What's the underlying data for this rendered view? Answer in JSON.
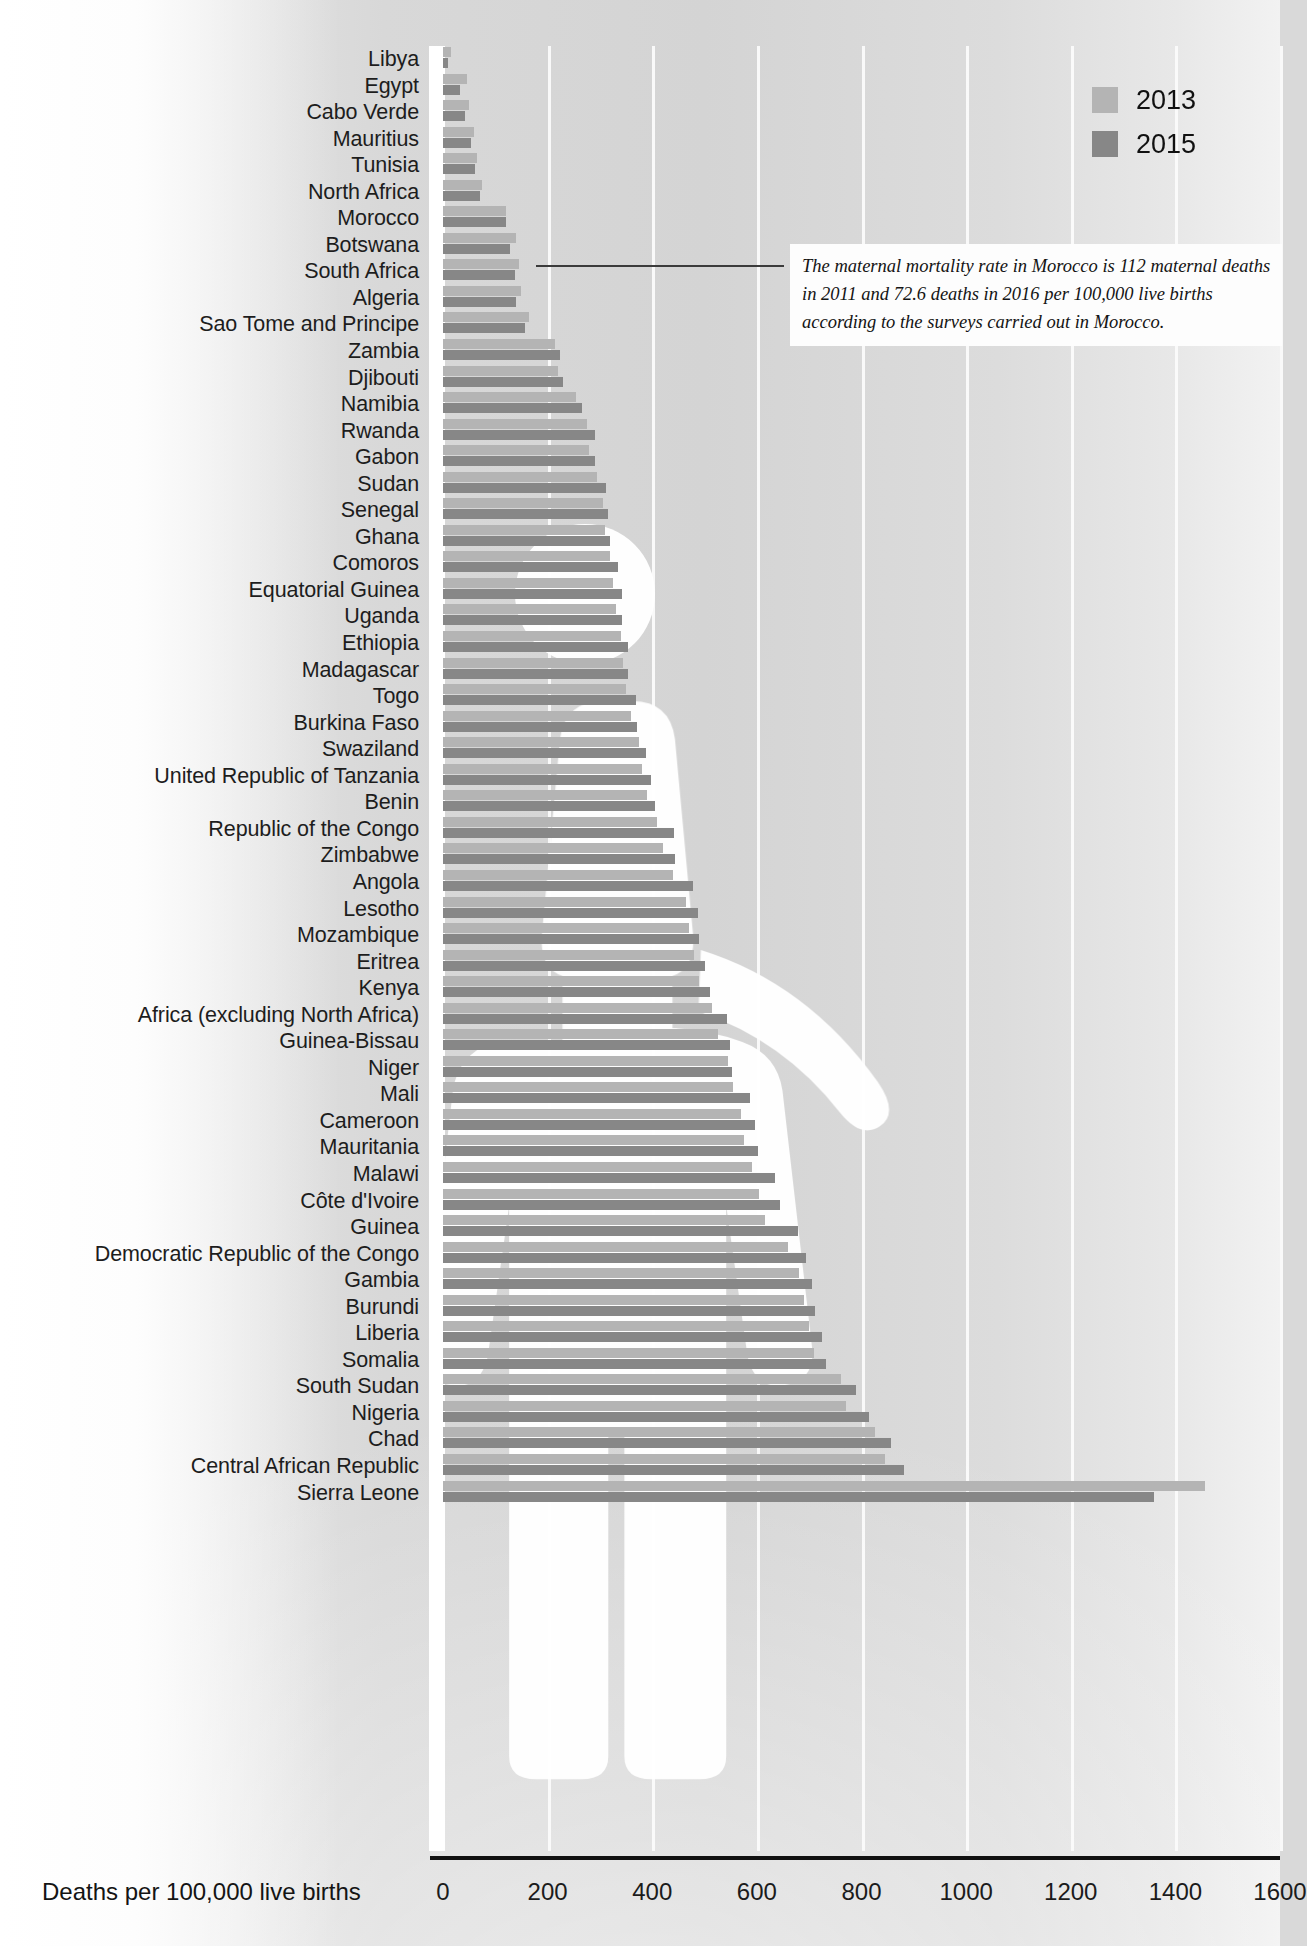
{
  "chart_data": {
    "type": "bar",
    "orientation": "horizontal",
    "title": "",
    "xlabel": "Deaths per 100,000 live births",
    "ylabel": "",
    "xlim": [
      0,
      1600
    ],
    "xticks": [
      0,
      200,
      400,
      600,
      800,
      1000,
      1200,
      1400,
      1600
    ],
    "grid": true,
    "legend_position": "top-right",
    "colors": {
      "2013": "#b4b4b4",
      "2015": "#878787",
      "axis": "#111111",
      "gridline": "#fbfbfb"
    },
    "categories": [
      "Libya",
      "Egypt",
      "Cabo Verde",
      "Mauritius",
      "Tunisia",
      "North Africa",
      "Morocco",
      "Botswana",
      "South Africa",
      "Algeria",
      "Sao Tome and Principe",
      "Zambia",
      "Djibouti",
      "Namibia",
      "Rwanda",
      "Gabon",
      "Sudan",
      "Senegal",
      "Ghana",
      "Comoros",
      "Equatorial Guinea",
      "Uganda",
      "Ethiopia",
      "Madagascar",
      "Togo",
      "Burkina Faso",
      "Swaziland",
      "United Republic of Tanzania",
      "Benin",
      "Republic of the Congo",
      "Zimbabwe",
      "Angola",
      "Lesotho",
      "Mozambique",
      "Eritrea",
      "Kenya",
      "Africa (excluding North Africa)",
      "Guinea-Bissau",
      "Niger",
      "Mali",
      "Cameroon",
      "Mauritania",
      "Malawi",
      "Côte d'Ivoire",
      "Guinea",
      "Democratic Republic of the Congo",
      "Gambia",
      "Burundi",
      "Liberia",
      "Somalia",
      "South Sudan",
      "Nigeria",
      "Chad",
      "Central African Republic",
      "Sierra Leone"
    ],
    "series": [
      {
        "name": "2013",
        "values": [
          15,
          45,
          50,
          60,
          65,
          75,
          120,
          140,
          145,
          150,
          165,
          215,
          220,
          255,
          275,
          280,
          295,
          305,
          310,
          320,
          325,
          330,
          340,
          345,
          350,
          360,
          375,
          380,
          390,
          410,
          420,
          440,
          465,
          470,
          480,
          490,
          515,
          525,
          545,
          555,
          570,
          575,
          590,
          605,
          615,
          660,
          680,
          690,
          700,
          710,
          760,
          770,
          825,
          845,
          1457
        ]
      },
      {
        "name": "2015",
        "values": [
          9,
          33,
          42,
          53,
          62,
          70,
          121,
          129,
          138,
          140,
          156,
          224,
          229,
          265,
          290,
          291,
          311,
          315,
          319,
          335,
          342,
          343,
          353,
          353,
          368,
          371,
          389,
          398,
          405,
          442,
          443,
          477,
          487,
          489,
          501,
          510,
          542,
          549,
          553,
          587,
          596,
          602,
          634,
          645,
          679,
          693,
          706,
          712,
          725,
          732,
          789,
          814,
          856,
          882,
          1360
        ]
      }
    ]
  },
  "legend": {
    "items": [
      {
        "label": "2013",
        "color": "#b4b4b4"
      },
      {
        "label": "2015",
        "color": "#878787"
      }
    ]
  },
  "axis": {
    "title": "Deaths per 100,000 live births",
    "ticks": [
      "0",
      "200",
      "400",
      "600",
      "800",
      "1000",
      "1200",
      "1400",
      "1600"
    ]
  },
  "annotation": {
    "text": "The maternal mortality rate in Morocco is 112 maternal deaths in 2011 and 72.6 deaths in 2016 per 100,000 live births according to the surveys carried out in Morocco.",
    "target": "Morocco"
  },
  "watermark": {
    "name": "woman-silhouette",
    "color": "#ffffff"
  }
}
